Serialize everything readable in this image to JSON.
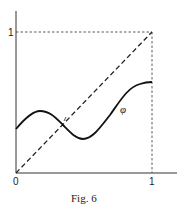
{
  "figure": {
    "caption": "Fig. 6",
    "curve_label": "φ",
    "axis": {
      "x_ticks": [
        {
          "label": "0",
          "value": 0
        },
        {
          "label": "1",
          "value": 1
        }
      ],
      "y_ticks": [
        {
          "label": "1",
          "value": 1
        }
      ]
    },
    "elements": [
      {
        "type": "axes",
        "description": "x and y axes from origin"
      },
      {
        "type": "dashed-line",
        "description": "diagonal y = x from (0,0) to (1,1)"
      },
      {
        "type": "dashed-line",
        "description": "horizontal y = 1 from x=0 to x=1"
      },
      {
        "type": "dashed-line",
        "description": "vertical x = 1 from y=0 to y=1"
      },
      {
        "type": "solid-curve",
        "label": "φ",
        "description": "continuous function on [0,1] starting near 0.3, peaking near 0.45, dipping near 0.25, ending near 0.6; crosses diagonal once"
      }
    ],
    "colors": {
      "ink": "#222222",
      "background": "#ffffff"
    }
  }
}
